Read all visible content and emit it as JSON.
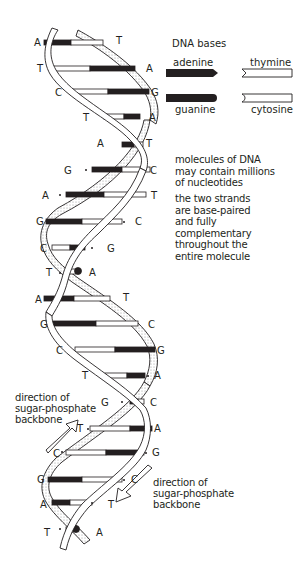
{
  "legend": {
    "title": "DNA bases",
    "items": [
      {
        "name": "adenine",
        "shape": "black-pointed-bar"
      },
      {
        "name": "thymine",
        "shape": "white-notched-bar"
      },
      {
        "name": "guanine",
        "shape": "black-rounded-bar"
      },
      {
        "name": "cytosine",
        "shape": "white-notched-bar"
      }
    ]
  },
  "notes": {
    "note1": "molecules of DNA\nmay contain millions\nof nucleotides",
    "note2": "the two strands\nare base-paired\nand fully\ncomplementary\nthroughout the\nentire molecule"
  },
  "arrows": {
    "left_label": "direction of\nsugar-phosphate\nbackbone",
    "right_label": "direction of\nsugar-phosphate\nbackbone"
  },
  "colors": {
    "ink": "#231f20",
    "stipple": "#bdbdbd",
    "background": "#ffffff"
  },
  "base_pairs": [
    {
      "left": "A",
      "right": "T",
      "y": 43
    },
    {
      "left": "T",
      "right": "A",
      "y": 69
    },
    {
      "left": "C",
      "right": "G",
      "y": 92
    },
    {
      "left": "T",
      "right": "A",
      "y": 117
    },
    {
      "left": "A",
      "right": "T",
      "y": 145
    },
    {
      "left": "G",
      "right": "C",
      "y": 170
    },
    {
      "left": "A",
      "right": "T",
      "y": 195
    },
    {
      "left": "G",
      "right": "C",
      "y": 222
    },
    {
      "left": "C",
      "right": "G",
      "y": 248
    },
    {
      "left": "T",
      "right": "A",
      "y": 272
    },
    {
      "left": "A",
      "right": "T",
      "y": 299
    },
    {
      "left": "G",
      "right": "C",
      "y": 324
    },
    {
      "left": "C",
      "right": "G",
      "y": 350
    },
    {
      "left": "T",
      "right": "A",
      "y": 376
    },
    {
      "left": "G",
      "right": "C",
      "y": 402
    },
    {
      "left": "T",
      "right": "A",
      "y": 429
    },
    {
      "left": "C",
      "right": "G",
      "y": 453
    },
    {
      "left": "G",
      "right": "C",
      "y": 480
    },
    {
      "left": "A",
      "right": "T",
      "y": 503
    },
    {
      "left": "T",
      "right": "A",
      "y": 530
    }
  ]
}
